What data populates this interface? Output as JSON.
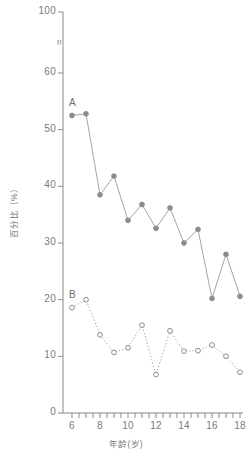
{
  "chart_data": {
    "type": "line",
    "title": "",
    "subtitle": "",
    "xlabel": "年龄(岁)",
    "ylabel": "百分比（%）",
    "xlim": [
      5.5,
      18.5
    ],
    "ylim": [
      0,
      62
    ],
    "y_axis_break": true,
    "y_axis_break_symbol": "≈",
    "grid": false,
    "legend_position": "inline-series-labels",
    "y_tick_labels": [
      "0",
      "10",
      "20",
      "30",
      "40",
      "50",
      "60",
      "100"
    ],
    "y_tick_values": [
      0,
      10,
      20,
      30,
      40,
      50,
      60,
      100
    ],
    "x_tick_labels": [
      "6",
      "8",
      "10",
      "12",
      "14",
      "16",
      "18"
    ],
    "x_tick_values": [
      6,
      8,
      10,
      12,
      14,
      16,
      18
    ],
    "x_minor_tick_values": [
      6,
      6.5,
      7,
      7.5,
      8,
      8.5,
      9,
      9.5,
      10,
      10.5,
      11,
      11.5,
      12,
      12.5,
      13,
      13.5,
      14,
      14.5,
      15,
      15.5,
      16,
      16.5,
      17,
      17.5,
      18
    ],
    "marker_color": "#8c8c8c",
    "line_color": "#9a9a9a",
    "axis_color": "#8a8a8a",
    "text_color": "#7a7a7a",
    "series": [
      {
        "name": "A",
        "label": "A",
        "marker": "filled-circle",
        "line_style": "solid",
        "x": [
          6,
          7,
          8,
          9,
          10,
          11,
          12,
          13,
          14,
          15,
          16,
          17,
          18
        ],
        "values": [
          52.5,
          52.8,
          38.5,
          41.8,
          34.0,
          36.8,
          32.6,
          36.2,
          30.0,
          32.4,
          20.2,
          28.0,
          20.6
        ]
      },
      {
        "name": "B",
        "label": "B",
        "marker": "open-circle",
        "line_style": "dotted",
        "x": [
          6,
          7,
          8,
          9,
          10,
          11,
          12,
          13,
          14,
          15,
          16,
          17,
          18
        ],
        "values": [
          18.6,
          20.0,
          13.8,
          10.7,
          11.5,
          15.5,
          6.8,
          14.5,
          10.9,
          11.0,
          12.0,
          10.0,
          7.2
        ]
      }
    ]
  }
}
